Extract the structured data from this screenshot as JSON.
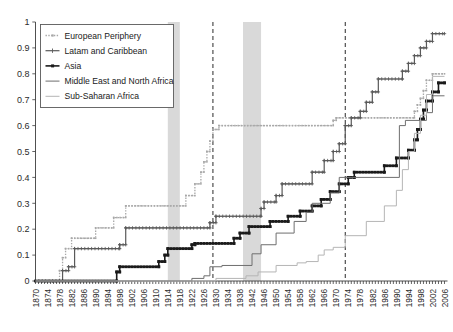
{
  "chart_data": {
    "type": "line",
    "title": "",
    "subtitle": "",
    "xlabel": "",
    "ylabel": "",
    "xlim": [
      1870,
      2007
    ],
    "ylim": [
      0,
      1
    ],
    "grid": false,
    "legend_position": "top-left",
    "y_ticks": [
      "0",
      "0.1",
      "0.2",
      "0.3",
      "0.4",
      "0.5",
      "0.6",
      "0.7",
      "0.8",
      "0.9",
      "1"
    ],
    "y_tick_values": [
      0,
      0.1,
      0.2,
      0.3,
      0.4,
      0.5,
      0.6,
      0.7,
      0.8,
      0.9,
      1
    ],
    "x_ticks": [
      "1870",
      "1874",
      "1878",
      "1882",
      "1886",
      "1890",
      "1894",
      "1898",
      "1902",
      "1906",
      "1910",
      "1914",
      "1918",
      "1922",
      "1926",
      "1930",
      "1934",
      "1938",
      "1942",
      "1946",
      "1950",
      "1954",
      "1958",
      "1962",
      "1966",
      "1970",
      "1974",
      "1978",
      "1982",
      "1986",
      "1990",
      "1994",
      "1998",
      "2002",
      "2006"
    ],
    "x_tick_values": [
      1870,
      1874,
      1878,
      1882,
      1886,
      1890,
      1894,
      1898,
      1902,
      1906,
      1910,
      1914,
      1918,
      1922,
      1926,
      1930,
      1934,
      1938,
      1942,
      1946,
      1950,
      1954,
      1958,
      1962,
      1966,
      1970,
      1974,
      1978,
      1982,
      1986,
      1990,
      1994,
      1998,
      2002,
      2006
    ],
    "x_minor_step": 1,
    "shaded_bands": [
      {
        "name": "wwi-band",
        "start": 1914,
        "end": 1918,
        "color": "#d2d2d2"
      },
      {
        "name": "wwii-band",
        "start": 1939,
        "end": 1945,
        "color": "#d2d2d2"
      }
    ],
    "event_lines": [
      {
        "name": "great-depression-line",
        "x": 1929,
        "style": "dashed",
        "color": "#2a2a2a"
      },
      {
        "name": "bretton-woods-end-line",
        "x": 1973,
        "style": "dashed",
        "color": "#2a2a2a"
      }
    ],
    "series": [
      {
        "name": "European Periphery",
        "key": "european-periphery",
        "color": "#a8a8a8",
        "marker": "dot",
        "linestyle": "dotted",
        "width": 1.3,
        "points": [
          [
            1870,
            0.0
          ],
          [
            1878,
            0.0
          ],
          [
            1878,
            0.04
          ],
          [
            1879,
            0.04
          ],
          [
            1879,
            0.09
          ],
          [
            1880,
            0.09
          ],
          [
            1880,
            0.125
          ],
          [
            1882,
            0.125
          ],
          [
            1882,
            0.165
          ],
          [
            1890,
            0.165
          ],
          [
            1890,
            0.205
          ],
          [
            1896,
            0.205
          ],
          [
            1896,
            0.245
          ],
          [
            1900,
            0.245
          ],
          [
            1900,
            0.29
          ],
          [
            1920,
            0.29
          ],
          [
            1920,
            0.33
          ],
          [
            1923,
            0.33
          ],
          [
            1923,
            0.375
          ],
          [
            1925,
            0.375
          ],
          [
            1925,
            0.42
          ],
          [
            1926,
            0.42
          ],
          [
            1926,
            0.46
          ],
          [
            1927,
            0.46
          ],
          [
            1927,
            0.5
          ],
          [
            1928,
            0.5
          ],
          [
            1928,
            0.54
          ],
          [
            1929,
            0.54
          ],
          [
            1929,
            0.585
          ],
          [
            1931,
            0.585
          ],
          [
            1931,
            0.6
          ],
          [
            1969,
            0.6
          ],
          [
            1969,
            0.62
          ],
          [
            1970,
            0.62
          ],
          [
            1970,
            0.63
          ],
          [
            1996,
            0.63
          ],
          [
            1996,
            0.655
          ],
          [
            1997,
            0.655
          ],
          [
            1997,
            0.68
          ],
          [
            1998,
            0.68
          ],
          [
            1998,
            0.705
          ],
          [
            1999,
            0.705
          ],
          [
            1999,
            0.735
          ],
          [
            2000,
            0.735
          ],
          [
            2000,
            0.775
          ],
          [
            2002,
            0.775
          ],
          [
            2002,
            0.8
          ],
          [
            2006,
            0.8
          ]
        ]
      },
      {
        "name": "Latam and Caribbean",
        "key": "latam-and-caribbean",
        "color": "#5a5a5a",
        "marker": "plus",
        "linestyle": "solid",
        "width": 1.2,
        "points": [
          [
            1870,
            0.0
          ],
          [
            1879,
            0.0
          ],
          [
            1879,
            0.04
          ],
          [
            1881,
            0.04
          ],
          [
            1881,
            0.055
          ],
          [
            1883,
            0.055
          ],
          [
            1883,
            0.125
          ],
          [
            1898,
            0.125
          ],
          [
            1898,
            0.14
          ],
          [
            1900,
            0.14
          ],
          [
            1900,
            0.205
          ],
          [
            1928,
            0.205
          ],
          [
            1928,
            0.225
          ],
          [
            1930,
            0.225
          ],
          [
            1930,
            0.25
          ],
          [
            1945,
            0.25
          ],
          [
            1945,
            0.28
          ],
          [
            1946,
            0.28
          ],
          [
            1946,
            0.305
          ],
          [
            1950,
            0.305
          ],
          [
            1950,
            0.33
          ],
          [
            1952,
            0.33
          ],
          [
            1952,
            0.375
          ],
          [
            1962,
            0.375
          ],
          [
            1962,
            0.42
          ],
          [
            1966,
            0.42
          ],
          [
            1966,
            0.465
          ],
          [
            1969,
            0.465
          ],
          [
            1969,
            0.5
          ],
          [
            1971,
            0.5
          ],
          [
            1971,
            0.53
          ],
          [
            1973,
            0.53
          ],
          [
            1973,
            0.6
          ],
          [
            1975,
            0.6
          ],
          [
            1975,
            0.63
          ],
          [
            1978,
            0.63
          ],
          [
            1978,
            0.655
          ],
          [
            1980,
            0.655
          ],
          [
            1980,
            0.69
          ],
          [
            1982,
            0.69
          ],
          [
            1982,
            0.73
          ],
          [
            1984,
            0.73
          ],
          [
            1984,
            0.78
          ],
          [
            1992,
            0.78
          ],
          [
            1992,
            0.81
          ],
          [
            1994,
            0.81
          ],
          [
            1994,
            0.84
          ],
          [
            1996,
            0.84
          ],
          [
            1996,
            0.87
          ],
          [
            1998,
            0.87
          ],
          [
            1998,
            0.9
          ],
          [
            2000,
            0.9
          ],
          [
            2000,
            0.925
          ],
          [
            2002,
            0.925
          ],
          [
            2002,
            0.955
          ],
          [
            2006,
            0.955
          ]
        ]
      },
      {
        "name": "Asia",
        "key": "asia",
        "color": "#1a1a1a",
        "marker": "square",
        "linestyle": "solid",
        "width": 1.6,
        "points": [
          [
            1870,
            0.0
          ],
          [
            1897,
            0.0
          ],
          [
            1897,
            0.035
          ],
          [
            1898,
            0.035
          ],
          [
            1898,
            0.055
          ],
          [
            1911,
            0.055
          ],
          [
            1911,
            0.075
          ],
          [
            1913,
            0.075
          ],
          [
            1913,
            0.1
          ],
          [
            1914,
            0.1
          ],
          [
            1914,
            0.125
          ],
          [
            1922,
            0.125
          ],
          [
            1922,
            0.14
          ],
          [
            1923,
            0.14
          ],
          [
            1923,
            0.145
          ],
          [
            1936,
            0.145
          ],
          [
            1936,
            0.165
          ],
          [
            1938,
            0.165
          ],
          [
            1938,
            0.185
          ],
          [
            1941,
            0.185
          ],
          [
            1941,
            0.21
          ],
          [
            1948,
            0.21
          ],
          [
            1948,
            0.23
          ],
          [
            1954,
            0.23
          ],
          [
            1954,
            0.25
          ],
          [
            1958,
            0.25
          ],
          [
            1958,
            0.27
          ],
          [
            1962,
            0.27
          ],
          [
            1962,
            0.29
          ],
          [
            1965,
            0.29
          ],
          [
            1965,
            0.315
          ],
          [
            1968,
            0.315
          ],
          [
            1968,
            0.345
          ],
          [
            1971,
            0.345
          ],
          [
            1971,
            0.375
          ],
          [
            1974,
            0.375
          ],
          [
            1974,
            0.4
          ],
          [
            1976,
            0.4
          ],
          [
            1976,
            0.42
          ],
          [
            1986,
            0.42
          ],
          [
            1986,
            0.445
          ],
          [
            1990,
            0.445
          ],
          [
            1990,
            0.475
          ],
          [
            1994,
            0.475
          ],
          [
            1994,
            0.505
          ],
          [
            1996,
            0.505
          ],
          [
            1996,
            0.545
          ],
          [
            1997,
            0.545
          ],
          [
            1997,
            0.585
          ],
          [
            1998,
            0.585
          ],
          [
            1998,
            0.625
          ],
          [
            1999,
            0.625
          ],
          [
            1999,
            0.66
          ],
          [
            2000,
            0.66
          ],
          [
            2000,
            0.695
          ],
          [
            2002,
            0.695
          ],
          [
            2002,
            0.73
          ],
          [
            2004,
            0.73
          ],
          [
            2004,
            0.765
          ],
          [
            2006,
            0.765
          ]
        ]
      },
      {
        "name": "Middle East and North Africa",
        "key": "middle-east-and-north-africa",
        "color": "#6e6e6e",
        "marker": "none",
        "linestyle": "solid",
        "width": 1.0,
        "points": [
          [
            1870,
            0.0
          ],
          [
            1922,
            0.0
          ],
          [
            1922,
            0.01
          ],
          [
            1926,
            0.01
          ],
          [
            1926,
            0.02
          ],
          [
            1928,
            0.02
          ],
          [
            1928,
            0.055
          ],
          [
            1932,
            0.055
          ],
          [
            1932,
            0.06
          ],
          [
            1942,
            0.06
          ],
          [
            1942,
            0.105
          ],
          [
            1945,
            0.105
          ],
          [
            1945,
            0.14
          ],
          [
            1950,
            0.14
          ],
          [
            1950,
            0.185
          ],
          [
            1956,
            0.185
          ],
          [
            1956,
            0.23
          ],
          [
            1960,
            0.23
          ],
          [
            1960,
            0.265
          ],
          [
            1962,
            0.265
          ],
          [
            1962,
            0.3
          ],
          [
            1968,
            0.3
          ],
          [
            1968,
            0.34
          ],
          [
            1971,
            0.34
          ],
          [
            1971,
            0.4
          ],
          [
            1991,
            0.4
          ],
          [
            1991,
            0.6
          ],
          [
            1993,
            0.6
          ],
          [
            1993,
            0.62
          ],
          [
            2000,
            0.62
          ],
          [
            2000,
            0.65
          ],
          [
            2002,
            0.65
          ],
          [
            2002,
            0.715
          ],
          [
            2006,
            0.715
          ]
        ]
      },
      {
        "name": "Sub-Saharan Africa",
        "key": "sub-saharan-africa",
        "color": "#b5b5b5",
        "marker": "none",
        "linestyle": "solid",
        "width": 1.0,
        "points": [
          [
            1870,
            0.0
          ],
          [
            1930,
            0.0
          ],
          [
            1930,
            0.01
          ],
          [
            1940,
            0.01
          ],
          [
            1940,
            0.02
          ],
          [
            1944,
            0.02
          ],
          [
            1944,
            0.035
          ],
          [
            1950,
            0.035
          ],
          [
            1950,
            0.06
          ],
          [
            1957,
            0.06
          ],
          [
            1957,
            0.07
          ],
          [
            1960,
            0.07
          ],
          [
            1960,
            0.075
          ],
          [
            1964,
            0.075
          ],
          [
            1964,
            0.1
          ],
          [
            1966,
            0.1
          ],
          [
            1966,
            0.12
          ],
          [
            1969,
            0.12
          ],
          [
            1969,
            0.13
          ],
          [
            1973,
            0.13
          ],
          [
            1973,
            0.175
          ],
          [
            1980,
            0.175
          ],
          [
            1980,
            0.23
          ],
          [
            1986,
            0.23
          ],
          [
            1986,
            0.29
          ],
          [
            1990,
            0.29
          ],
          [
            1990,
            0.35
          ],
          [
            1992,
            0.35
          ],
          [
            1992,
            0.43
          ],
          [
            1994,
            0.43
          ],
          [
            1994,
            0.5
          ],
          [
            1996,
            0.5
          ],
          [
            1996,
            0.57
          ],
          [
            1998,
            0.57
          ],
          [
            1998,
            0.64
          ],
          [
            2000,
            0.64
          ],
          [
            2000,
            0.72
          ],
          [
            2002,
            0.72
          ],
          [
            2002,
            0.79
          ],
          [
            2006,
            0.79
          ]
        ]
      }
    ],
    "legend": [
      {
        "label": "European Periphery",
        "key": "european-periphery"
      },
      {
        "label": "Latam and Caribbean",
        "key": "latam-and-caribbean"
      },
      {
        "label": "Asia",
        "key": "asia"
      },
      {
        "label": "Middle East and North Africa",
        "key": "middle-east-and-north-africa"
      },
      {
        "label": "Sub-Saharan Africa",
        "key": "sub-saharan-africa"
      }
    ]
  }
}
